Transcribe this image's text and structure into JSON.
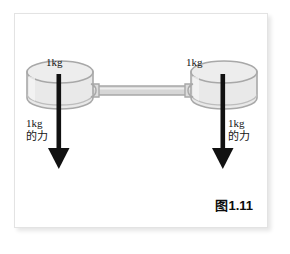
{
  "figure": {
    "caption": "图1.11",
    "background_color": "#ffffff",
    "frame_border_color": "#e3e3e3"
  },
  "diagram": {
    "type": "physics-force-diagram",
    "cylinder_fill_color": "#e9e9e9",
    "cylinder_stroke_color": "#a8a8a8",
    "rod_fill_color": "#d6d6d6",
    "rod_stroke_color": "#a8a8a8",
    "arrow_color": "#111111",
    "weights": [
      {
        "id": "left",
        "mass_label": "1kg",
        "force_value": "1kg",
        "force_unit_text": "的力"
      },
      {
        "id": "right",
        "mass_label": "1kg",
        "force_value": "1kg",
        "force_unit_text": "的力"
      }
    ]
  }
}
